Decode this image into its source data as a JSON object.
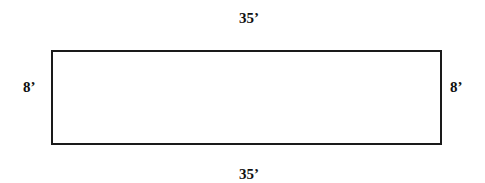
{
  "diagram": {
    "shape": "rectangle",
    "stroke_color": "#1a1a1a",
    "fill_color": "#ffffff",
    "dimensions": {
      "top": "35’",
      "bottom": "35’",
      "left": "8’",
      "right": "8’"
    },
    "length_ft": 35,
    "width_ft": 8
  }
}
